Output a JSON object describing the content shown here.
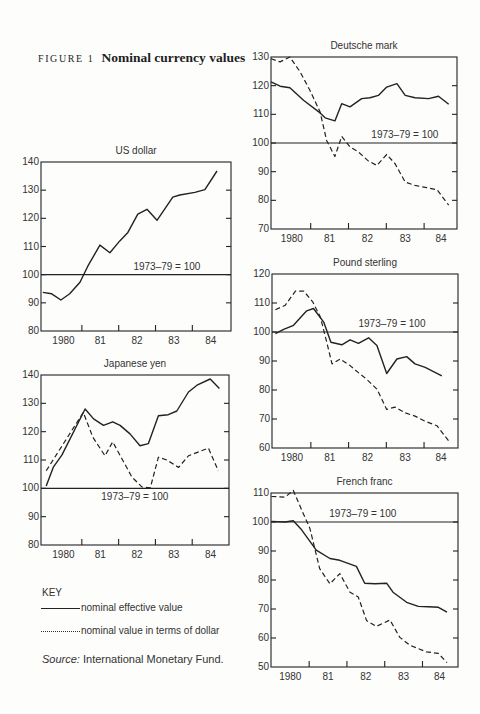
{
  "figure": {
    "label": "FIGURE 1",
    "title": "Nominal currency values"
  },
  "key": {
    "title": "KEY",
    "solid_label": "nominal effective value",
    "dashed_label": "nominal value in terms of dollar"
  },
  "source": {
    "label": "Source:",
    "text": " International Monetary Fund."
  },
  "colors": {
    "line": "#222222",
    "background": "#fdfdfc"
  },
  "chart_data": [
    {
      "type": "line",
      "title": "US dollar",
      "xlabel": "",
      "ylabel": "",
      "xlim": [
        1979.89,
        1985.05
      ],
      "ylim": [
        80,
        140
      ],
      "yticks": [
        80,
        90,
        100,
        110,
        120,
        130,
        140
      ],
      "xtick_marks": [
        1981,
        1982,
        1983,
        1984
      ],
      "xtick_labels": [
        {
          "x": 1980.5,
          "label": "1980"
        },
        {
          "x": 1981.5,
          "label": "81"
        },
        {
          "x": 1982.5,
          "label": "82"
        },
        {
          "x": 1983.5,
          "label": "83"
        },
        {
          "x": 1984.5,
          "label": "84"
        }
      ],
      "reference": {
        "value": 100,
        "label": "1973–79 = 100",
        "label_x": 1983.31,
        "label_pos": "above"
      },
      "grid": false,
      "series": [
        {
          "name": "nominal effective value",
          "style": "solid",
          "points": [
            [
              1979.94,
              93.7
            ],
            [
              1980.18,
              93.2
            ],
            [
              1980.43,
              91.0
            ],
            [
              1980.67,
              93.2
            ],
            [
              1980.95,
              97.3
            ],
            [
              1981.16,
              103.0
            ],
            [
              1981.49,
              110.5
            ],
            [
              1981.76,
              107.8
            ],
            [
              1982.03,
              112.0
            ],
            [
              1982.25,
              115.0
            ],
            [
              1982.52,
              121.5
            ],
            [
              1982.77,
              123.2
            ],
            [
              1983.04,
              119.3
            ],
            [
              1983.47,
              127.5
            ],
            [
              1983.66,
              128.3
            ],
            [
              1984.07,
              129.2
            ],
            [
              1984.34,
              130.2
            ],
            [
              1984.67,
              136.8
            ]
          ]
        }
      ]
    },
    {
      "type": "line",
      "title": "Japanese yen",
      "xlabel": "",
      "ylabel": "",
      "xlim": [
        1979.89,
        1985.0
      ],
      "ylim": [
        80,
        140
      ],
      "yticks": [
        80,
        90,
        100,
        110,
        120,
        130,
        140
      ],
      "xtick_marks": [
        1981,
        1982,
        1983,
        1984
      ],
      "xtick_labels": [
        {
          "x": 1980.5,
          "label": "1980"
        },
        {
          "x": 1981.5,
          "label": "81"
        },
        {
          "x": 1982.5,
          "label": "82"
        },
        {
          "x": 1983.5,
          "label": "83"
        },
        {
          "x": 1984.5,
          "label": "84"
        }
      ],
      "reference": {
        "value": 100,
        "label": "1973–79 = 100",
        "label_x": 1982.44,
        "label_pos": "below"
      },
      "grid": false,
      "series": [
        {
          "name": "nominal effective value",
          "style": "solid",
          "points": [
            [
              1980.03,
              100.8
            ],
            [
              1980.23,
              107.6
            ],
            [
              1980.46,
              111.8
            ],
            [
              1981.09,
              128.0
            ],
            [
              1981.32,
              124.5
            ],
            [
              1981.59,
              122.2
            ],
            [
              1981.84,
              123.5
            ],
            [
              1982.04,
              122.2
            ],
            [
              1982.31,
              119.2
            ],
            [
              1982.58,
              115.0
            ],
            [
              1982.81,
              115.8
            ],
            [
              1983.08,
              125.6
            ],
            [
              1983.35,
              126.0
            ],
            [
              1983.58,
              127.3
            ],
            [
              1983.9,
              134.0
            ],
            [
              1984.13,
              136.4
            ],
            [
              1984.49,
              138.6
            ],
            [
              1984.74,
              135.2
            ]
          ]
        },
        {
          "name": "nominal value in terms of dollar",
          "style": "dashed",
          "points": [
            [
              1980.03,
              106.2
            ],
            [
              1981.04,
              126.8
            ],
            [
              1981.3,
              118.0
            ],
            [
              1981.63,
              111.5
            ],
            [
              1981.84,
              116.4
            ],
            [
              1982.36,
              104.0
            ],
            [
              1982.63,
              100.5
            ],
            [
              1982.86,
              100.2
            ],
            [
              1983.08,
              111.0
            ],
            [
              1983.31,
              110.0
            ],
            [
              1983.63,
              107.4
            ],
            [
              1983.9,
              111.5
            ],
            [
              1984.44,
              114.2
            ],
            [
              1984.71,
              106.2
            ]
          ]
        }
      ]
    },
    {
      "type": "line",
      "title": "Deutsche mark",
      "xlabel": "",
      "ylabel": "",
      "xlim": [
        1979.95,
        1984.87
      ],
      "ylim": [
        70,
        130
      ],
      "yticks": [
        70,
        80,
        90,
        100,
        110,
        120,
        130
      ],
      "xtick_marks": [
        1981,
        1982,
        1983,
        1984
      ],
      "xtick_labels": [
        {
          "x": 1980.5,
          "label": "1980"
        },
        {
          "x": 1981.5,
          "label": "81"
        },
        {
          "x": 1982.5,
          "label": "82"
        },
        {
          "x": 1983.5,
          "label": "83"
        },
        {
          "x": 1984.45,
          "label": "84"
        }
      ],
      "reference": {
        "value": 100,
        "label": "1973–79 = 100",
        "label_x": 1983.49,
        "label_pos": "above"
      },
      "grid": false,
      "series": [
        {
          "name": "nominal effective value",
          "style": "solid",
          "points": [
            [
              1979.95,
              121.3
            ],
            [
              1980.19,
              119.8
            ],
            [
              1980.45,
              119.3
            ],
            [
              1980.81,
              114.9
            ],
            [
              1981.25,
              110.5
            ],
            [
              1981.38,
              108.8
            ],
            [
              1981.64,
              107.7
            ],
            [
              1981.82,
              113.7
            ],
            [
              1982.04,
              112.6
            ],
            [
              1982.35,
              115.5
            ],
            [
              1982.57,
              115.8
            ],
            [
              1982.79,
              116.6
            ],
            [
              1983.01,
              119.5
            ],
            [
              1983.28,
              120.7
            ],
            [
              1983.5,
              116.6
            ],
            [
              1983.76,
              115.8
            ],
            [
              1984.12,
              115.5
            ],
            [
              1984.38,
              116.3
            ],
            [
              1984.65,
              113.5
            ]
          ]
        },
        {
          "name": "nominal value in terms of dollar",
          "style": "dashed",
          "points": [
            [
              1979.95,
              129.4
            ],
            [
              1980.19,
              128.3
            ],
            [
              1980.45,
              130.0
            ],
            [
              1980.72,
              124.8
            ],
            [
              1980.98,
              118.4
            ],
            [
              1981.25,
              110.8
            ],
            [
              1981.42,
              100.9
            ],
            [
              1981.64,
              95.3
            ],
            [
              1981.82,
              102.3
            ],
            [
              1982.04,
              98.6
            ],
            [
              1982.26,
              96.9
            ],
            [
              1982.53,
              93.7
            ],
            [
              1982.75,
              92.2
            ],
            [
              1983.01,
              96.0
            ],
            [
              1983.23,
              92.8
            ],
            [
              1983.5,
              86.4
            ],
            [
              1983.76,
              85.2
            ],
            [
              1984.07,
              84.4
            ],
            [
              1984.34,
              83.7
            ],
            [
              1984.65,
              78.3
            ]
          ]
        }
      ]
    },
    {
      "type": "line",
      "title": "Pound sterling",
      "xlabel": "",
      "ylabel": "",
      "xlim": [
        1979.97,
        1984.9
      ],
      "ylim": [
        60,
        120
      ],
      "yticks": [
        60,
        70,
        80,
        90,
        100,
        110,
        120
      ],
      "xtick_marks": [
        1981,
        1982,
        1983,
        1984
      ],
      "xtick_labels": [
        {
          "x": 1980.5,
          "label": "1980"
        },
        {
          "x": 1981.5,
          "label": "81"
        },
        {
          "x": 1982.5,
          "label": "82"
        },
        {
          "x": 1983.5,
          "label": "83"
        },
        {
          "x": 1984.45,
          "label": "84"
        }
      ],
      "reference": {
        "value": 100,
        "label": "1973–79 = 100",
        "label_x": 1983.15,
        "label_pos": "above"
      },
      "grid": false,
      "series": [
        {
          "name": "nominal effective value",
          "style": "solid",
          "points": [
            [
              1980.06,
              99.4
            ],
            [
              1980.28,
              100.9
            ],
            [
              1980.54,
              102.3
            ],
            [
              1980.89,
              107.3
            ],
            [
              1981.07,
              108.1
            ],
            [
              1981.34,
              103.4
            ],
            [
              1981.53,
              96.5
            ],
            [
              1981.82,
              95.6
            ],
            [
              1982.04,
              97.3
            ],
            [
              1982.26,
              96.1
            ],
            [
              1982.53,
              98.0
            ],
            [
              1982.75,
              95.3
            ],
            [
              1983.01,
              85.7
            ],
            [
              1983.28,
              90.7
            ],
            [
              1983.54,
              91.5
            ],
            [
              1983.76,
              89.0
            ],
            [
              1984.03,
              87.8
            ],
            [
              1984.47,
              84.9
            ]
          ]
        },
        {
          "name": "nominal value in terms of dollar",
          "style": "dashed",
          "points": [
            [
              1980.06,
              107.7
            ],
            [
              1980.32,
              109.2
            ],
            [
              1980.59,
              114.1
            ],
            [
              1980.81,
              114.1
            ],
            [
              1981.05,
              110.4
            ],
            [
              1981.25,
              105.2
            ],
            [
              1981.41,
              97.1
            ],
            [
              1981.56,
              89.0
            ],
            [
              1981.78,
              90.7
            ],
            [
              1982.04,
              88.4
            ],
            [
              1982.26,
              86.0
            ],
            [
              1982.48,
              83.7
            ],
            [
              1982.75,
              80.3
            ],
            [
              1983.01,
              73.3
            ],
            [
              1983.23,
              74.1
            ],
            [
              1983.5,
              72.1
            ],
            [
              1983.76,
              71.0
            ],
            [
              1984.03,
              69.2
            ],
            [
              1984.34,
              67.7
            ],
            [
              1984.65,
              62.5
            ]
          ]
        }
      ]
    },
    {
      "type": "line",
      "title": "French franc",
      "xlabel": "",
      "ylabel": "",
      "xlim": [
        1979.99,
        1984.94
      ],
      "ylim": [
        50,
        110
      ],
      "yticks": [
        50,
        60,
        70,
        80,
        90,
        100,
        110
      ],
      "xtick_marks": [
        1981,
        1982,
        1983,
        1984
      ],
      "xtick_labels": [
        {
          "x": 1980.5,
          "label": "1980"
        },
        {
          "x": 1981.5,
          "label": "81"
        },
        {
          "x": 1982.5,
          "label": "82"
        },
        {
          "x": 1983.5,
          "label": "83"
        },
        {
          "x": 1984.45,
          "label": "84"
        }
      ],
      "reference": {
        "value": 100,
        "label": "1973–79 = 100",
        "label_x": 1982.42,
        "label_pos": "above"
      },
      "grid": false,
      "series": [
        {
          "name": "nominal effective value",
          "style": "solid",
          "points": [
            [
              1980.0,
              100.2
            ],
            [
              1980.36,
              100.0
            ],
            [
              1980.58,
              100.4
            ],
            [
              1980.8,
              97.3
            ],
            [
              1981.19,
              90.3
            ],
            [
              1981.55,
              87.4
            ],
            [
              1981.81,
              86.8
            ],
            [
              1982.25,
              84.7
            ],
            [
              1982.47,
              78.9
            ],
            [
              1982.74,
              78.7
            ],
            [
              1983.05,
              78.9
            ],
            [
              1983.22,
              75.8
            ],
            [
              1983.58,
              72.3
            ],
            [
              1983.89,
              70.9
            ],
            [
              1984.15,
              70.8
            ],
            [
              1984.42,
              70.6
            ],
            [
              1984.65,
              68.9
            ]
          ]
        },
        {
          "name": "nominal value in terms of dollar",
          "style": "dashed",
          "points": [
            [
              1980.0,
              108.8
            ],
            [
              1980.36,
              108.6
            ],
            [
              1980.58,
              110.9
            ],
            [
              1980.8,
              104.2
            ],
            [
              1981.02,
              97.8
            ],
            [
              1981.28,
              83.9
            ],
            [
              1981.55,
              78.7
            ],
            [
              1981.81,
              82.2
            ],
            [
              1982.08,
              75.8
            ],
            [
              1982.3,
              74.1
            ],
            [
              1982.52,
              66.0
            ],
            [
              1982.78,
              64.0
            ],
            [
              1983.14,
              66.2
            ],
            [
              1983.4,
              60.2
            ],
            [
              1983.67,
              57.5
            ],
            [
              1984.11,
              55.2
            ],
            [
              1984.42,
              54.7
            ],
            [
              1984.65,
              51.5
            ]
          ]
        }
      ]
    }
  ]
}
